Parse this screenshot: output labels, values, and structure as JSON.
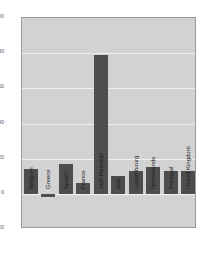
{
  "chart_data": {
    "type": "bar",
    "title": "",
    "subtitle": "",
    "xlabel": "",
    "ylabel": "",
    "ylim": [
      -20,
      100
    ],
    "yticks": [
      100,
      80,
      60,
      40,
      20,
      0,
      -20
    ],
    "ytick_labels": [
      "100",
      "80",
      "60",
      "40",
      "20",
      "0",
      "-20"
    ],
    "grid": true,
    "legend": "none",
    "categories": [
      "Belgium",
      "Greece",
      "Spain*",
      "France",
      "Irish Republic",
      "Italy",
      "Luxembourg",
      "Netherlands",
      "Portugal",
      "United Kingdom"
    ],
    "values": [
      14,
      -2,
      17,
      6,
      79,
      10,
      13,
      15,
      13,
      13
    ],
    "series": [
      {
        "name": "",
        "values": [
          14,
          -2,
          17,
          6,
          79,
          10,
          13,
          15,
          13,
          13
        ]
      }
    ],
    "annotations": [],
    "colors": {
      "bar": "#4d4d4d",
      "plot_background": "#d2d2d2",
      "gridline": "#f0f0f0",
      "frame": "#9a9a9a",
      "page_background": "#ffffff",
      "tick_text": "#5a5a5a",
      "category_text": "#1c1c1c"
    }
  }
}
